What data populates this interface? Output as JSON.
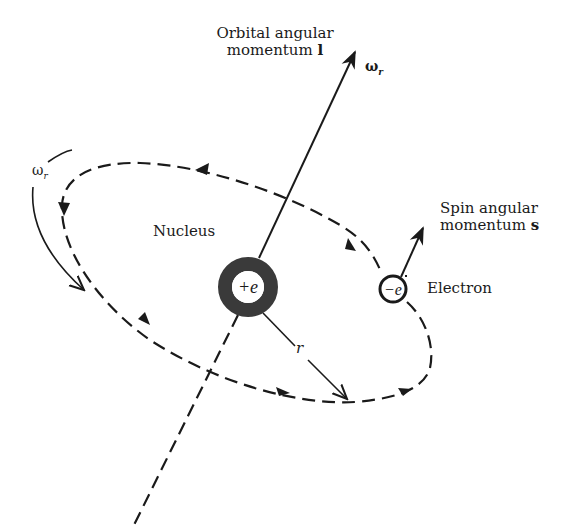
{
  "figure": {
    "colors": {
      "ink": "#1a1a1a",
      "nucleus_ring": "#3a3a3a",
      "background": "#ffffff"
    }
  },
  "labels": {
    "orbital_line1": "Orbital angular",
    "orbital_line2": "momentum",
    "orbital_symbol": "l",
    "omega_top": "ω",
    "omega_top_sub": "r",
    "omega_left": "ω",
    "omega_left_sub": "r",
    "nucleus": "Nucleus",
    "nucleus_charge": "+e",
    "electron": "Electron",
    "electron_charge": "−e",
    "spin_line1": "Spin angular",
    "spin_line2": "momentum",
    "spin_symbol": "s",
    "radius": "r"
  },
  "geometry": {
    "nucleus_center": [
      248,
      287
    ],
    "nucleus_outer_radius": 30,
    "nucleus_inner_radius": 16,
    "electron_center": [
      393,
      289
    ],
    "electron_radius": 14,
    "orbital_arrow_tip": [
      356,
      50
    ],
    "spin_arrow_tip": [
      424,
      225
    ],
    "radius_arrow_tip": [
      348,
      400
    ]
  }
}
